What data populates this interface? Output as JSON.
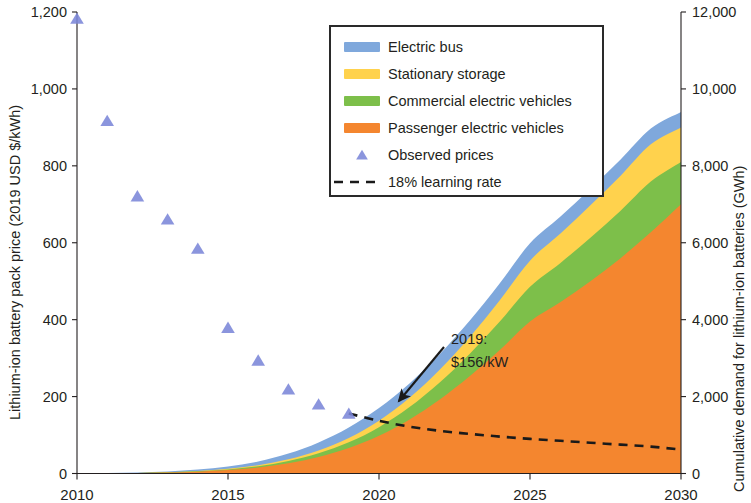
{
  "chart_data": {
    "type": "area",
    "title": "",
    "subtitle": "",
    "xlabel": "",
    "ylabel": "Lithium-ion battery pack price (2019 USD $/kWh)",
    "y2label": "Cumulative demand for lithium-ion batteries (GWh)",
    "xlim": [
      2010,
      2030
    ],
    "ylim": [
      0,
      1200
    ],
    "y2lim": [
      0,
      12000
    ],
    "grid": false,
    "legend_position": "top-center",
    "x_ticks": [
      "2010",
      "2015",
      "2020",
      "2025",
      "2030"
    ],
    "x_tick_values": [
      2010,
      2015,
      2020,
      2025,
      2030
    ],
    "y_ticks": [
      "0",
      "200",
      "400",
      "600",
      "800",
      "1,000",
      "1,200"
    ],
    "y_tick_values": [
      0,
      200,
      400,
      600,
      800,
      1000,
      1200
    ],
    "y2_ticks": [
      "0",
      "2,000",
      "4,000",
      "6,000",
      "8,000",
      "10,000",
      "12,000"
    ],
    "y2_tick_values": [
      0,
      2000,
      4000,
      6000,
      8000,
      10000,
      12000
    ],
    "x": [
      2010,
      2011,
      2012,
      2013,
      2014,
      2015,
      2016,
      2017,
      2018,
      2019,
      2020,
      2021,
      2022,
      2023,
      2024,
      2025,
      2026,
      2027,
      2028,
      2029,
      2030
    ],
    "series": [
      {
        "name": "Passenger electric vehicles",
        "color": "#F4862F",
        "axis": "right",
        "stack_order": 1,
        "values": [
          2,
          5,
          12,
          25,
          48,
          88,
          155,
          265,
          430,
          660,
          980,
          1400,
          1920,
          2530,
          3210,
          3950,
          4450,
          5000,
          5600,
          6270,
          7000
        ]
      },
      {
        "name": "Commercial electric vehicles",
        "color": "#7DBF4A",
        "axis": "right",
        "stack_order": 2,
        "values": [
          0,
          1,
          2,
          5,
          10,
          18,
          33,
          58,
          95,
          150,
          225,
          320,
          440,
          580,
          740,
          905,
          1020,
          1130,
          1230,
          1320,
          1100
        ]
      },
      {
        "name": "Stationary storage",
        "color": "#FFD24D",
        "axis": "right",
        "stack_order": 3,
        "values": [
          0,
          1,
          2,
          4,
          8,
          15,
          26,
          45,
          72,
          112,
          168,
          240,
          330,
          435,
          555,
          680,
          765,
          845,
          915,
          970,
          900
        ]
      },
      {
        "name": "Electric bus",
        "color": "#7FA8DC",
        "axis": "right",
        "stack_order": 4,
        "values": [
          1,
          3,
          8,
          18,
          35,
          62,
          100,
          150,
          210,
          275,
          330,
          375,
          405,
          425,
          440,
          450,
          440,
          430,
          420,
          410,
          400
        ]
      }
    ],
    "stacked_totals_2030": {
      "Passenger electric vehicles": 7000,
      "Commercial electric vehicles": 8100,
      "Stationary storage": 9000,
      "Electric bus": 9400
    },
    "observed_prices": {
      "name": "Observed prices",
      "color": "#7B86D8",
      "marker": "triangle",
      "axis": "left",
      "x": [
        2010,
        2011,
        2012,
        2013,
        2014,
        2015,
        2016,
        2017,
        2018,
        2019
      ],
      "values": [
        1183,
        917,
        721,
        661,
        585,
        379,
        294,
        219,
        180,
        156
      ]
    },
    "learning_rate_curve": {
      "name": "18% learning rate",
      "style": "dashed",
      "color": "#1a1a1a",
      "axis": "left",
      "x": [
        2019,
        2020,
        2021,
        2022,
        2023,
        2024,
        2025,
        2026,
        2027,
        2028,
        2029,
        2030
      ],
      "values": [
        156,
        137,
        122,
        111,
        103,
        96,
        90,
        85,
        80,
        75,
        70,
        62
      ]
    },
    "annotations": [
      {
        "name": "2019-price-callout",
        "line1": "2019:",
        "line2": "$156/kW",
        "points_to_x": 2019,
        "points_to_y": 156
      }
    ],
    "legend": [
      {
        "label": "Electric bus",
        "color": "#7FA8DC",
        "marker": "swatch"
      },
      {
        "label": "Stationary storage",
        "color": "#FFD24D",
        "marker": "swatch"
      },
      {
        "label": "Commercial electric vehicles",
        "color": "#7DBF4A",
        "marker": "swatch"
      },
      {
        "label": "Passenger electric vehicles",
        "color": "#F4862F",
        "marker": "swatch"
      },
      {
        "label": "Observed prices",
        "color": "#7B86D8",
        "marker": "triangle"
      },
      {
        "label": "18% learning rate",
        "color": "#1a1a1a",
        "marker": "dashed-line"
      }
    ]
  },
  "axes": {
    "left_title": "Lithium-ion battery pack price (2019 USD $/kWh)",
    "right_title": "Cumulative demand for lithium-ion batteries (GWh)",
    "left_ticks": [
      "1,200",
      "1,000",
      "800",
      "600",
      "400",
      "200",
      "0"
    ],
    "right_ticks": [
      "12,000",
      "10,000",
      "8,000",
      "6,000",
      "4,000",
      "2,000",
      "0"
    ],
    "bottom_ticks": [
      "2010",
      "2015",
      "2020",
      "2025",
      "2030"
    ]
  },
  "legend": {
    "items": [
      {
        "label": "Electric bus"
      },
      {
        "label": "Stationary storage"
      },
      {
        "label": "Commercial electric vehicles"
      },
      {
        "label": "Passenger electric vehicles"
      },
      {
        "label": "Observed prices"
      },
      {
        "label": "18% learning rate"
      }
    ]
  },
  "annotation": {
    "line1": "2019:",
    "line2": "$156/kW"
  },
  "colors": {
    "electric_bus": "#7FA8DC",
    "stationary_storage": "#FFD24D",
    "commercial_ev": "#7DBF4A",
    "passenger_ev": "#F4862F",
    "observed_prices": "#7B86D8",
    "learning_rate": "#1a1a1a",
    "axis": "#231f20"
  }
}
